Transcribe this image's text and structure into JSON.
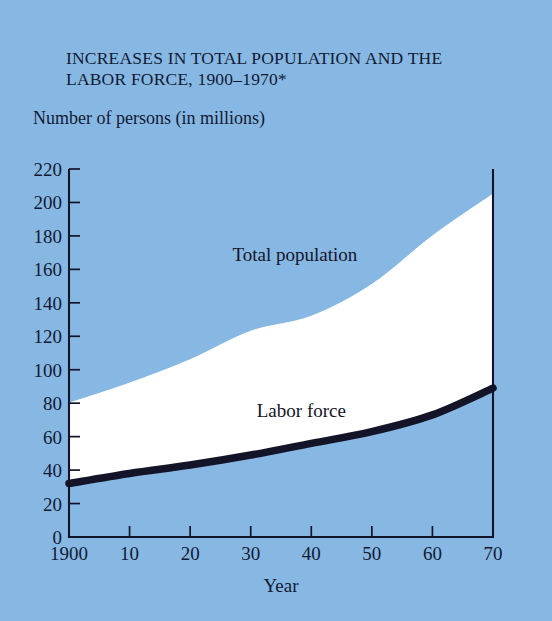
{
  "figure": {
    "title": "INCREASES IN TOTAL POPULATION AND\nTHE LABOR FORCE,  1900–1970*",
    "subtitle": "Number of persons (in millions)",
    "background_color": "#87b8e4",
    "band_color": "#ffffff",
    "line_color": "#141428",
    "text_color": "#121a33"
  },
  "chart_data": {
    "type": "area",
    "title": "INCREASES IN TOTAL POPULATION AND THE LABOR FORCE,  1900–1970*",
    "subtitle": "Number of persons (in millions)",
    "xlabel": "Year",
    "ylabel": "Number of persons (in millions)",
    "xlim": [
      1900,
      1970
    ],
    "ylim": [
      0,
      220
    ],
    "grid": false,
    "legend": "inline-annotations",
    "x": [
      1900,
      1910,
      1920,
      1930,
      1940,
      1950,
      1960,
      1970
    ],
    "xtick_labels": [
      "1900",
      "10",
      "20",
      "30",
      "40",
      "50",
      "60",
      "70"
    ],
    "ytick_labels": [
      "0",
      "20",
      "40",
      "60",
      "80",
      "100",
      "120",
      "140",
      "160",
      "180",
      "200",
      "220"
    ],
    "ytick_values": [
      0,
      20,
      40,
      60,
      80,
      100,
      120,
      140,
      160,
      180,
      200,
      220
    ],
    "series": [
      {
        "name": "Total population",
        "label": "Total population",
        "values": [
          80,
          92,
          106,
          123,
          132,
          151,
          180,
          205
        ]
      },
      {
        "name": "Labor force",
        "label": "Labor force",
        "values": [
          32,
          38,
          43,
          49,
          56,
          63,
          73,
          89
        ]
      }
    ],
    "annotations": [
      {
        "text": "Total population",
        "x": 1927,
        "y": 165
      },
      {
        "text": "Labor force",
        "x": 1931,
        "y": 72
      }
    ]
  }
}
